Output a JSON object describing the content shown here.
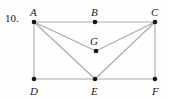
{
  "figure": {
    "problem_number": "10.",
    "canvas": {
      "width": 169,
      "height": 101
    },
    "style": {
      "background_color": "#fefefe",
      "edge_color": "#a9a9a9",
      "vertex_color": "#141414",
      "label_color": "#1a1a1a"
    },
    "vertices": [
      {
        "id": "A",
        "label": "A",
        "x": 34,
        "y": 22,
        "label_x": 30,
        "label_y": 16
      },
      {
        "id": "B",
        "label": "B",
        "x": 95,
        "y": 22,
        "label_x": 91,
        "label_y": 16
      },
      {
        "id": "C",
        "label": "C",
        "x": 155,
        "y": 22,
        "label_x": 151,
        "label_y": 16
      },
      {
        "id": "G",
        "label": "G",
        "x": 96,
        "y": 51,
        "label_x": 90,
        "label_y": 45
      },
      {
        "id": "D",
        "label": "D",
        "x": 34,
        "y": 79,
        "label_x": 30,
        "label_y": 95
      },
      {
        "id": "E",
        "label": "E",
        "x": 95,
        "y": 79,
        "label_x": 91,
        "label_y": 95
      },
      {
        "id": "F",
        "label": "F",
        "x": 155,
        "y": 79,
        "label_x": 152,
        "label_y": 95
      }
    ],
    "edges": [
      {
        "id": "A-B",
        "from": "A",
        "to": "B"
      },
      {
        "id": "B-C",
        "from": "B",
        "to": "C"
      },
      {
        "id": "D-E",
        "from": "D",
        "to": "E"
      },
      {
        "id": "E-F",
        "from": "E",
        "to": "F"
      },
      {
        "id": "A-D",
        "from": "A",
        "to": "D"
      },
      {
        "id": "C-F",
        "from": "C",
        "to": "F"
      },
      {
        "id": "A-G",
        "from": "A",
        "to": "G"
      },
      {
        "id": "G-C",
        "from": "G",
        "to": "C"
      },
      {
        "id": "A-E",
        "from": "A",
        "to": "E"
      },
      {
        "id": "C-E",
        "from": "C",
        "to": "E"
      }
    ],
    "label_position": {
      "problem_x": 5,
      "problem_y": 13
    }
  }
}
